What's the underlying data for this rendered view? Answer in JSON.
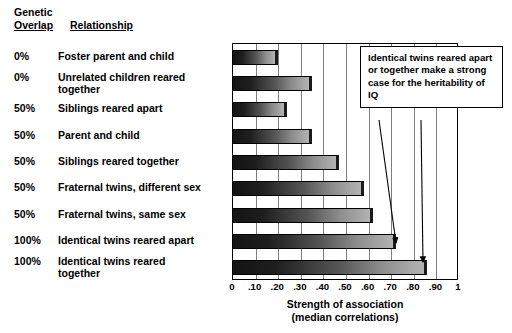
{
  "header": {
    "line1": "Genetic",
    "overlap_label": "Overlap",
    "relationship_label": "Relationship"
  },
  "annotation": {
    "text": "Identical twins reared apart or together make a strong case for the heritability of IQ"
  },
  "axis": {
    "title": "Strength of association",
    "subtitle": "(median correlations)",
    "ticks": [
      "0",
      ".10",
      ".20",
      ".30",
      ".40",
      ".50",
      ".60",
      ".70",
      ".80",
      ".90",
      "1"
    ]
  },
  "chart_data": {
    "type": "bar",
    "orientation": "horizontal",
    "title": "",
    "xlabel": "Strength of association (median correlations)",
    "ylabel": "",
    "xlim": [
      0,
      1
    ],
    "xticks": [
      0,
      0.1,
      0.2,
      0.3,
      0.4,
      0.5,
      0.6,
      0.7,
      0.8,
      0.9,
      1
    ],
    "xticklabels": [
      "0",
      ".10",
      ".20",
      ".30",
      ".40",
      ".50",
      ".60",
      ".70",
      ".80",
      ".90",
      "1"
    ],
    "grid": true,
    "legend": false,
    "categories": [
      "Foster parent and child",
      "Unrelated children reared together",
      "Siblings reared apart",
      "Parent and child",
      "Siblings reared together",
      "Fraternal twins, different sex",
      "Fraternal twins, same sex",
      "Identical twins reared apart",
      "Identical twins reared together"
    ],
    "values": [
      0.2,
      0.35,
      0.24,
      0.35,
      0.47,
      0.58,
      0.62,
      0.72,
      0.86
    ],
    "genetic_overlap": [
      "0%",
      "0%",
      "50%",
      "50%",
      "50%",
      "50%",
      "50%",
      "100%",
      "100%"
    ],
    "annotations": [
      {
        "text": "Identical twins reared apart or together make a strong case for the heritability of IQ",
        "points_to": [
          "Identical twins reared apart",
          "Identical twins reared together"
        ]
      }
    ],
    "colors": {
      "bar_gradient_start": "#141414",
      "bar_gradient_end": "#b3b3b3",
      "bar_cap": "#1a1a1a",
      "gridline": "#7d7d7d",
      "frame": "#000000",
      "background": "#ffffff"
    }
  },
  "rows": [
    {
      "pct": "0%",
      "label": "Foster parent and child",
      "two_line": false
    },
    {
      "pct": "0%",
      "label": "Unrelated children reared\n together",
      "two_line": true
    },
    {
      "pct": "50%",
      "label": "Siblings reared apart",
      "two_line": false
    },
    {
      "pct": "50%",
      "label": "Parent and child",
      "two_line": false
    },
    {
      "pct": "50%",
      "label": "Siblings reared together",
      "two_line": false
    },
    {
      "pct": "50%",
      "label": "Fraternal twins, different sex",
      "two_line": false
    },
    {
      "pct": "50%",
      "label": "Fraternal twins, same sex",
      "two_line": false
    },
    {
      "pct": "100%",
      "label": "Identical twins reared apart",
      "two_line": false
    },
    {
      "pct": "100%",
      "label": "Identical twins reared\n together",
      "two_line": true
    }
  ]
}
